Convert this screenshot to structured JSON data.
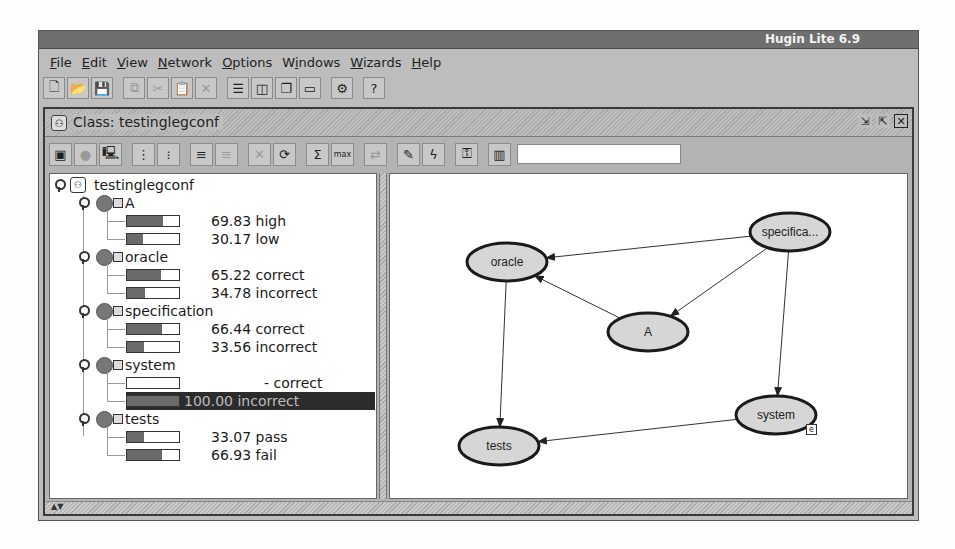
{
  "window": {
    "title": "Hugin Lite 6.9"
  },
  "menubar": {
    "items": [
      {
        "label": "File",
        "mnemonic": "F"
      },
      {
        "label": "Edit",
        "mnemonic": "E"
      },
      {
        "label": "View",
        "mnemonic": "V"
      },
      {
        "label": "Network",
        "mnemonic": "N"
      },
      {
        "label": "Options",
        "mnemonic": "O"
      },
      {
        "label": "Windows",
        "mnemonic": "i"
      },
      {
        "label": "Wizards",
        "mnemonic": "W"
      },
      {
        "label": "Help",
        "mnemonic": "H"
      }
    ]
  },
  "toolbar": {
    "buttons": [
      {
        "name": "new-icon",
        "glyph": "🗋",
        "enabled": true
      },
      {
        "name": "open-icon",
        "glyph": "📂",
        "enabled": true
      },
      {
        "name": "save-icon",
        "glyph": "💾",
        "enabled": true
      },
      {
        "name": "copy-icon",
        "glyph": "⧉",
        "enabled": false
      },
      {
        "name": "cut-icon",
        "glyph": "✂",
        "enabled": false
      },
      {
        "name": "paste-icon",
        "glyph": "📋",
        "enabled": false
      },
      {
        "name": "delete-icon",
        "glyph": "✕",
        "enabled": false
      },
      {
        "name": "tile-horizontal-icon",
        "glyph": "☰",
        "enabled": true
      },
      {
        "name": "tile-vertical-icon",
        "glyph": "◫",
        "enabled": true
      },
      {
        "name": "cascade-icon",
        "glyph": "❐",
        "enabled": true
      },
      {
        "name": "minimize-all-icon",
        "glyph": "▭",
        "enabled": true
      },
      {
        "name": "network-icon",
        "glyph": "⚙",
        "enabled": true
      },
      {
        "name": "help-icon",
        "glyph": "?",
        "enabled": true
      }
    ]
  },
  "class_frame": {
    "title": "Class: testinglegconf",
    "controls": [
      "restore",
      "maximize",
      "close"
    ],
    "toolbar": {
      "buttons": [
        {
          "name": "properties-icon",
          "glyph": "▣",
          "enabled": true
        },
        {
          "name": "compile-icon",
          "glyph": "●",
          "enabled": false
        },
        {
          "name": "run-mode-icon",
          "glyph": "🖳",
          "enabled": true
        },
        {
          "name": "expand-nodes-icon",
          "glyph": "⋮",
          "enabled": true
        },
        {
          "name": "expand-all-icon",
          "glyph": "⁝",
          "enabled": true
        },
        {
          "name": "node-list-icon",
          "glyph": "≡",
          "enabled": true
        },
        {
          "name": "collapse-list-icon",
          "glyph": "≡",
          "enabled": false
        },
        {
          "name": "retract-icon",
          "glyph": "✕",
          "enabled": false
        },
        {
          "name": "initialize-icon",
          "glyph": "⟳",
          "enabled": true
        },
        {
          "name": "sum-propagate-icon",
          "glyph": "Σ",
          "enabled": true
        },
        {
          "name": "max-propagate-icon",
          "glyph": "max",
          "enabled": true
        },
        {
          "name": "propagate-disabled-icon",
          "glyph": "⇄",
          "enabled": false
        },
        {
          "name": "edit-icon",
          "glyph": "✎",
          "enabled": true
        },
        {
          "name": "evidence-icon",
          "glyph": "ϟ",
          "enabled": true
        },
        {
          "name": "key-icon",
          "glyph": "⚿",
          "enabled": true
        },
        {
          "name": "data-icon",
          "glyph": "▥",
          "enabled": true
        }
      ],
      "search": {
        "value": "",
        "placeholder": ""
      }
    }
  },
  "tree": {
    "root": "testinglegconf",
    "nodes": [
      {
        "name": "A",
        "states": [
          {
            "value": "69.83",
            "label": "high",
            "pct": 69.83
          },
          {
            "value": "30.17",
            "label": "low",
            "pct": 30.17
          }
        ]
      },
      {
        "name": "oracle",
        "states": [
          {
            "value": "65.22",
            "label": "correct",
            "pct": 65.22
          },
          {
            "value": "34.78",
            "label": "incorrect",
            "pct": 34.78
          }
        ]
      },
      {
        "name": "specification",
        "states": [
          {
            "value": "66.44",
            "label": "correct",
            "pct": 66.44
          },
          {
            "value": "33.56",
            "label": "incorrect",
            "pct": 33.56
          }
        ]
      },
      {
        "name": "system",
        "states": [
          {
            "value": "-",
            "label": "correct",
            "pct": 0
          },
          {
            "value": "100.00",
            "label": "incorrect",
            "pct": 100,
            "selected": true
          }
        ]
      },
      {
        "name": "tests",
        "states": [
          {
            "value": "33.07",
            "label": "pass",
            "pct": 33.07
          },
          {
            "value": "66.93",
            "label": "fail",
            "pct": 66.93
          }
        ]
      }
    ]
  },
  "graph": {
    "nodes": [
      {
        "id": "oracle",
        "label": "oracle",
        "x": 117,
        "y": 88
      },
      {
        "id": "specification",
        "label": "specifica...",
        "x": 400,
        "y": 58
      },
      {
        "id": "A",
        "label": "A",
        "x": 258,
        "y": 158
      },
      {
        "id": "system",
        "label": "system",
        "x": 386,
        "y": 241,
        "evidence_badge": "e"
      },
      {
        "id": "tests",
        "label": "tests",
        "x": 109,
        "y": 272
      }
    ],
    "edges": [
      {
        "from": "specification",
        "to": "oracle"
      },
      {
        "from": "specification",
        "to": "A"
      },
      {
        "from": "A",
        "to": "oracle"
      },
      {
        "from": "specification",
        "to": "system"
      },
      {
        "from": "oracle",
        "to": "tests"
      },
      {
        "from": "system",
        "to": "tests"
      }
    ]
  },
  "colors": {
    "node_fill": "#d6d6d6",
    "node_stroke": "#1a1a1a",
    "bar_fill": "#6a6a6a",
    "selection_bg": "#2c2c2c"
  }
}
